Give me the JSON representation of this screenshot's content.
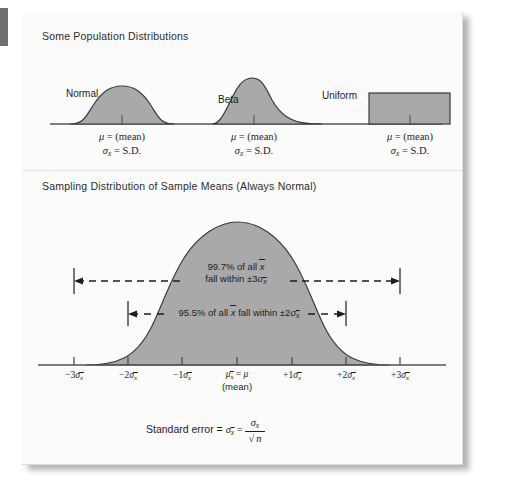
{
  "figure": {
    "type": "statistical-diagram",
    "top_panel": {
      "title": "Some Population Distributions",
      "distributions": [
        {
          "name": "Normal",
          "shape": "symmetric-bell",
          "mu_label": "μ = (mean)",
          "sd_label": "σx = S.D."
        },
        {
          "name": "Beta",
          "shape": "right-skewed",
          "mu_label": "μ = (mean)",
          "sd_label": "σx = S.D."
        },
        {
          "name": "Uniform",
          "shape": "rectangle",
          "mu_label": "μ = (mean)",
          "sd_label": "σx = S.D."
        }
      ]
    },
    "bottom_panel": {
      "title": "Sampling Distribution of Sample Means (Always Normal)",
      "bands": [
        {
          "percent": "99.7%",
          "line1": "99.7% of all x̄",
          "line2": "fall within ±3σx̄",
          "sigma_span": 3
        },
        {
          "percent": "95.5%",
          "line1": "95.5% of all x̄ fall within ±2σx̄",
          "sigma_span": 2
        }
      ],
      "axis_ticks": [
        {
          "sign": "−",
          "coef": "3",
          "symbol": "σ",
          "sub": "x̄",
          "text": "−3σx̄"
        },
        {
          "sign": "−",
          "coef": "2",
          "symbol": "σ",
          "sub": "x̄",
          "text": "−2σx̄"
        },
        {
          "sign": "−",
          "coef": "1",
          "symbol": "σ",
          "sub": "x̄",
          "text": "−1σx̄"
        },
        {
          "sign": "",
          "coef": "",
          "symbol": "μ",
          "sub": "x̄",
          "text": "μx̄ = μ",
          "text2": "(mean)"
        },
        {
          "sign": "+",
          "coef": "1",
          "symbol": "σ",
          "sub": "x̄",
          "text": "+1σx̄"
        },
        {
          "sign": "+",
          "coef": "2",
          "symbol": "σ",
          "sub": "x̄",
          "text": "+2σx̄"
        },
        {
          "sign": "+",
          "coef": "3",
          "symbol": "σ",
          "sub": "x̄",
          "text": "+3σx̄"
        }
      ],
      "standard_error": {
        "prefix": "Standard error = ",
        "lhs": "σx̄",
        "equals": "=",
        "numerator": "σx",
        "denominator": "n",
        "radical": "√",
        "full_text": "Standard error = σx̄ = σx / √n"
      }
    },
    "colors": {
      "page": "#fbfbfb",
      "curve_fill": "#a9a9a9",
      "curve_stroke": "#3a3a3a",
      "axis": "#555555",
      "text": "#1d1d1d",
      "shadow": "#9a9a9a",
      "edge_tab": "#6f6f6f"
    }
  }
}
